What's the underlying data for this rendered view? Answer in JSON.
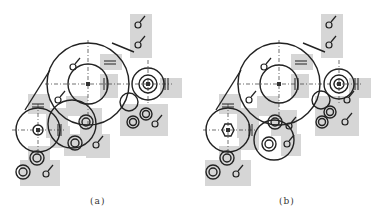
{
  "figure": {
    "panels": [
      {
        "id": "a",
        "caption": "(a)"
      },
      {
        "id": "b",
        "caption": "(b)"
      }
    ],
    "colors": {
      "line": "#222222",
      "shade": "#d4d4d4",
      "background": "#ffffff"
    },
    "elements": {
      "large_gear": "large-gear-circle",
      "left_gear": "left-gear-circle",
      "right_gear": "right-gear-circle",
      "small_rollers": "small-roller-circles",
      "bearing_symbols": "bearing-symbol",
      "tension_symbols": "tension-symbol",
      "belt_line": "belt-tangent-line"
    }
  }
}
